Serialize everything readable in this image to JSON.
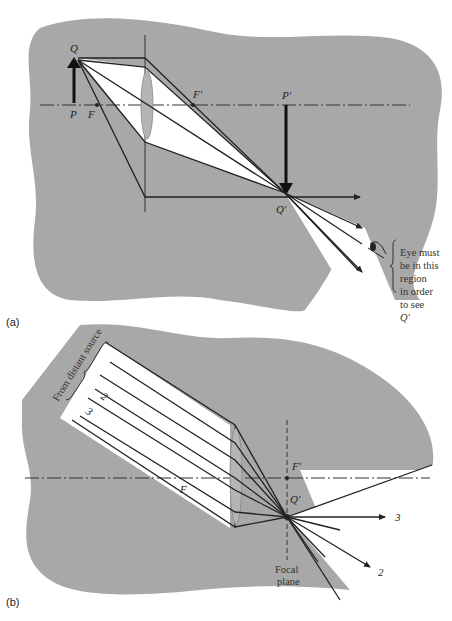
{
  "panel_a": {
    "panel_label": "(a)",
    "labels": {
      "object_top": "Q",
      "object_base": "P",
      "front_focus": "F",
      "back_focus": "F'",
      "image_base": "P'",
      "image_top": "Q'"
    },
    "annotation": [
      "Eye must",
      "be in this",
      "region",
      "in order",
      "to see",
      "Q'"
    ]
  },
  "panel_b": {
    "panel_label": "(b)",
    "labels": {
      "front_focus": "F",
      "back_focus": "F'",
      "image_point": "Q'",
      "ray_2_in": "2",
      "ray_3_in": "3",
      "ray_2_out": "2",
      "ray_3_out": "3"
    },
    "source_label": "From distant source",
    "focal_plane_label": [
      "Focal",
      "plane"
    ]
  },
  "colors": {
    "background_shape": "#a8a8a8",
    "ray_line": "#222222",
    "light_cone": "#ffffff"
  }
}
